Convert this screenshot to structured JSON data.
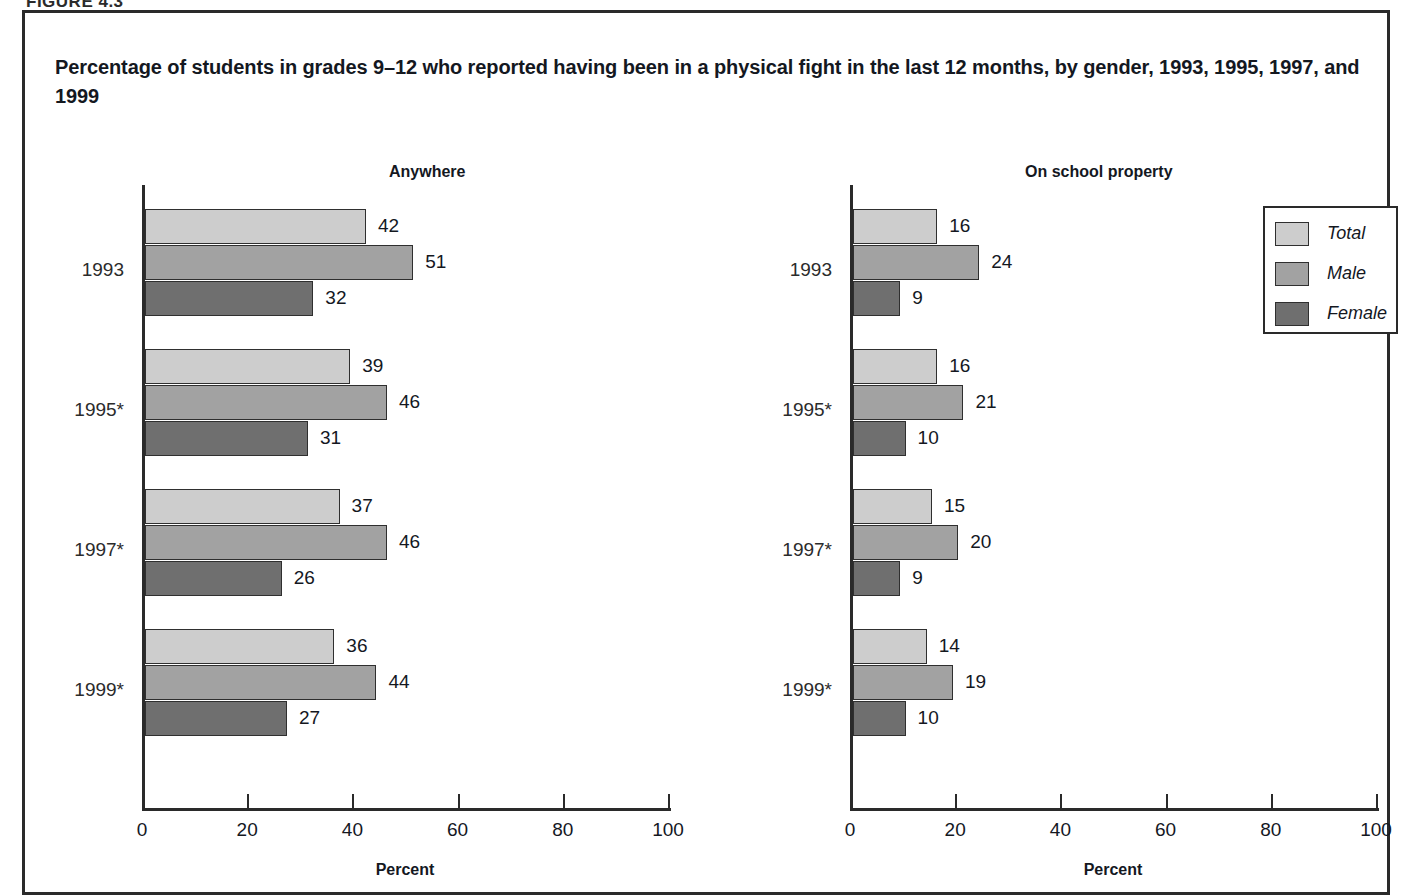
{
  "figure_number": "FIGURE 4.3",
  "title": "Percentage of students in grades 9–12 who reported having been in a physical fight in the last 12 months, by gender, 1993, 1995, 1997, and 1999",
  "legend": {
    "items": [
      {
        "label": "Total",
        "color": "#cdcdcd"
      },
      {
        "label": "Male",
        "color": "#a2a2a2"
      },
      {
        "label": "Female",
        "color": "#6f6f6f"
      }
    ]
  },
  "axis": {
    "tick_labels": [
      "0",
      "20",
      "40",
      "60",
      "80",
      "100"
    ],
    "caption": "Percent"
  },
  "chart_data": [
    {
      "type": "bar",
      "orientation": "horizontal",
      "title": "Anywhere",
      "xlabel": "Percent",
      "ylabel": "",
      "xlim": [
        0,
        100
      ],
      "xticks": [
        0,
        20,
        40,
        60,
        80,
        100
      ],
      "grid": false,
      "legend_position": "outside-right",
      "categories": [
        "1993",
        "1995*",
        "1997*",
        "1999*"
      ],
      "series": [
        {
          "name": "Total",
          "color": "#cdcdcd",
          "values": [
            42,
            39,
            37,
            36
          ]
        },
        {
          "name": "Male",
          "color": "#a2a2a2",
          "values": [
            51,
            46,
            46,
            44
          ]
        },
        {
          "name": "Female",
          "color": "#6f6f6f",
          "values": [
            32,
            31,
            26,
            27
          ]
        }
      ]
    },
    {
      "type": "bar",
      "orientation": "horizontal",
      "title": "On school property",
      "xlabel": "Percent",
      "ylabel": "",
      "xlim": [
        0,
        100
      ],
      "xticks": [
        0,
        20,
        40,
        60,
        80,
        100
      ],
      "grid": false,
      "legend_position": "outside-right",
      "categories": [
        "1993",
        "1995*",
        "1997*",
        "1999*"
      ],
      "series": [
        {
          "name": "Total",
          "color": "#cdcdcd",
          "values": [
            16,
            16,
            15,
            14
          ]
        },
        {
          "name": "Male",
          "color": "#a2a2a2",
          "values": [
            24,
            21,
            20,
            19
          ]
        },
        {
          "name": "Female",
          "color": "#6f6f6f",
          "values": [
            9,
            10,
            9,
            10
          ]
        }
      ]
    }
  ]
}
